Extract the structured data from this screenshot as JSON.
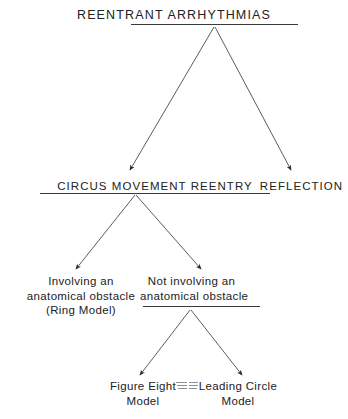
{
  "figure": {
    "title": "REENTRANT ARRHYTHMIAS",
    "background_color": "#ffffff",
    "ink_color": "#222222",
    "width": 348,
    "height": 419
  },
  "nodes": {
    "root": {
      "label": "REENTRANT ARRHYTHMIAS",
      "underlined": true
    },
    "circus_movement_reentry": {
      "label": "CIRCUS MOVEMENT REENTRY",
      "underlined": true
    },
    "reflection": {
      "label": "REFLECTION",
      "underlined": false
    },
    "ring_model": {
      "line1": "Involving an",
      "line2": "anatomical obstacle",
      "line3": "(Ring Model)",
      "underlined": false
    },
    "no_anatomical_obstacle": {
      "line1": "Not involving an",
      "line2": "anatomical obstacle",
      "underlined": true
    },
    "figure_eight_model": {
      "line1": "Figure Eight",
      "line2": "Model",
      "underlined": false
    },
    "leading_circle_model": {
      "line1": "Leading Circle",
      "line2": "Model",
      "underlined": false
    }
  },
  "edges": [
    {
      "from": "root",
      "to": "circus_movement_reentry",
      "arrow": true
    },
    {
      "from": "root",
      "to": "reflection",
      "arrow": true
    },
    {
      "from": "circus_movement_reentry",
      "to": "ring_model",
      "arrow": true
    },
    {
      "from": "circus_movement_reentry",
      "to": "no_anatomical_obstacle",
      "arrow": true
    },
    {
      "from": "no_anatomical_obstacle",
      "to": "figure_eight_model",
      "arrow": true
    },
    {
      "from": "no_anatomical_obstacle",
      "to": "leading_circle_model",
      "arrow": true
    }
  ]
}
